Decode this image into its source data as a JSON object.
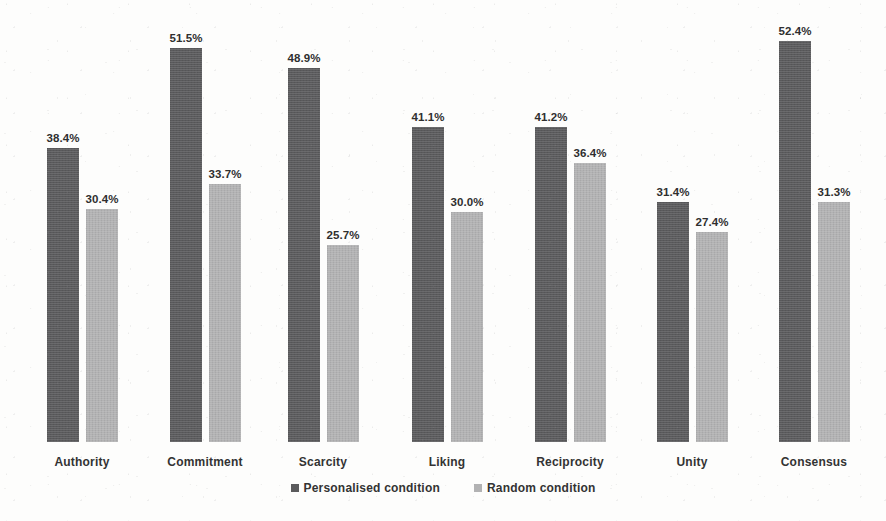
{
  "chart_data": {
    "type": "bar",
    "title": "",
    "subtitle": "",
    "xlabel": "",
    "ylabel": "",
    "ylim": [
      0,
      60
    ],
    "grid": false,
    "value_suffix": "%",
    "legend_position": "bottom-center",
    "categories": [
      "Authority",
      "Commitment",
      "Scarcity",
      "Liking",
      "Reciprocity",
      "Unity",
      "Consensus"
    ],
    "series": [
      {
        "name": "Personalised condition",
        "color": "#5a5a5c",
        "values": [
          38.4,
          51.5,
          48.9,
          41.1,
          41.2,
          31.4,
          52.4
        ],
        "labels": [
          "38.4%",
          "51.5%",
          "48.9%",
          "41.1%",
          "41.2%",
          "31.4%",
          "52.4%"
        ]
      },
      {
        "name": "Random condition",
        "color": "#b2b2b3",
        "values": [
          30.4,
          33.7,
          25.7,
          30.0,
          36.4,
          27.4,
          31.3
        ],
        "labels": [
          "30.4%",
          "33.7%",
          "25.7%",
          "30.0%",
          "36.4%",
          "27.4%",
          "31.3%"
        ]
      }
    ]
  },
  "legend": {
    "items": [
      {
        "label": "Personalised condition",
        "color": "#5a5a5c"
      },
      {
        "label": "Random condition",
        "color": "#b2b2b3"
      }
    ]
  },
  "groups": [
    {
      "category": "Authority",
      "left": 47,
      "personalised": {
        "label": "38.4%",
        "height": 294
      },
      "random": {
        "label": "30.4%",
        "height": 233
      }
    },
    {
      "category": "Commitment",
      "left": 170,
      "personalised": {
        "label": "51.5%",
        "height": 394
      },
      "random": {
        "label": "33.7%",
        "height": 258
      }
    },
    {
      "category": "Scarcity",
      "left": 288,
      "personalised": {
        "label": "48.9%",
        "height": 374
      },
      "random": {
        "label": "25.7%",
        "height": 197
      }
    },
    {
      "category": "Liking",
      "left": 412,
      "personalised": {
        "label": "41.1%",
        "height": 315
      },
      "random": {
        "label": "30.0%",
        "height": 230
      }
    },
    {
      "category": "Reciprocity",
      "left": 535,
      "personalised": {
        "label": "41.2%",
        "height": 315
      },
      "random": {
        "label": "36.4%",
        "height": 279
      }
    },
    {
      "category": "Unity",
      "left": 657,
      "personalised": {
        "label": "31.4%",
        "height": 240
      },
      "random": {
        "label": "27.4%",
        "height": 210
      }
    },
    {
      "category": "Consensus",
      "left": 779,
      "personalised": {
        "label": "52.4%",
        "height": 401
      },
      "random": {
        "label": "31.3%",
        "height": 240
      }
    }
  ]
}
